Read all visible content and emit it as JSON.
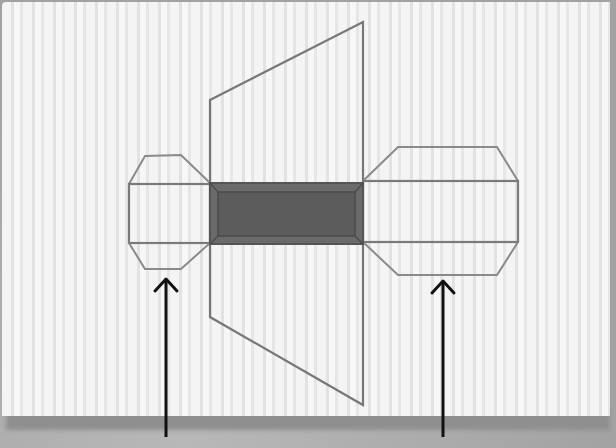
{
  "diagram": {
    "type": "net-of-3d-shape",
    "colors": {
      "paper": "#f4f4f4",
      "stripe": "#e2e2e2",
      "line": "#7a7a7a",
      "dark_face": "#5e5e5e",
      "dark_face_bevel": "#707070",
      "arrow": "#111111",
      "background": "#a9a9a9"
    },
    "shapes": {
      "trapezoid": {
        "points": "210,100 363,22 363,405 210,317"
      },
      "dark_face": {
        "x": 210,
        "y": 183,
        "width": 153,
        "height": 61
      },
      "dark_face_inner": {
        "x": 218,
        "y": 192,
        "width": 137,
        "height": 44
      },
      "left_cap_rect": {
        "x": 129,
        "y": 184,
        "width": 81,
        "height": 59
      },
      "left_cap_top": "129,184 145,156 181,155 210,183",
      "left_cap_bottom": "129,243 145,269 181,269 210,243",
      "right_cap_rect": {
        "x": 363,
        "y": 181,
        "width": 155,
        "height": 61
      },
      "right_cap_top": "363,181 398,147 497,147 518,181",
      "right_cap_bottom": "363,242 398,275 497,275 518,242"
    },
    "arrows": [
      {
        "label": "left-arrow",
        "x": 166,
        "y_start": 437,
        "y_end": 279
      },
      {
        "label": "right-arrow",
        "x": 443,
        "y_start": 437,
        "y_end": 281
      }
    ]
  }
}
